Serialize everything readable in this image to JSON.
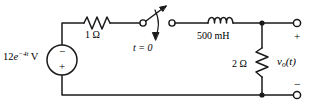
{
  "figure": {
    "kind": "electrical-circuit-schematic",
    "background_color": "#ffffff",
    "line_color": "#1a1a1a"
  },
  "source": {
    "name": "independent-voltage-source",
    "label_prefix": "12",
    "label_base": "e",
    "label_exponent": "−4t",
    "label_unit": " V",
    "terminal_top_sign": "−",
    "terminal_bottom_sign": "+"
  },
  "resistor_1": {
    "name": "series-resistor",
    "label": "1 Ω"
  },
  "switch": {
    "name": "switch",
    "label": "t = 0",
    "state": "open"
  },
  "inductor": {
    "name": "inductor",
    "label": "500 mH"
  },
  "resistor_2": {
    "name": "shunt-resistor",
    "label": "2 Ω"
  },
  "output": {
    "name": "output-port",
    "label": "v",
    "label_sub": "o",
    "label_suffix": "(t)",
    "plus_sign": "+",
    "minus_sign": "−"
  }
}
